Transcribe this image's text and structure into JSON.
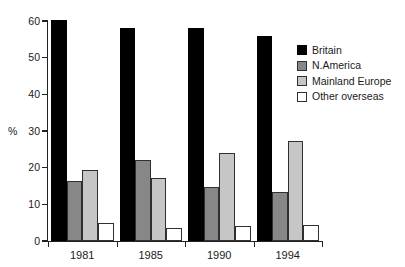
{
  "chart_data": {
    "type": "bar",
    "title": "",
    "subtitle": "",
    "xlabel": "",
    "ylabel": "%",
    "categories": [
      "1981",
      "1985",
      "1990",
      "1994"
    ],
    "series": [
      {
        "name": "Britain",
        "color": "#000000",
        "values": [
          60.3,
          58.2,
          58.2,
          56.0
        ]
      },
      {
        "name": "N.America",
        "color": "#878787",
        "values": [
          16.5,
          22.0,
          14.8,
          13.5
        ]
      },
      {
        "name": "Mainland Europe",
        "color": "#c6c6c6",
        "values": [
          19.3,
          17.3,
          24.1,
          27.2
        ]
      },
      {
        "name": "Other overseas",
        "color": "#ffffff",
        "values": [
          4.8,
          3.6,
          4.0,
          4.3
        ]
      }
    ],
    "ylim": [
      0,
      60
    ],
    "yticks": [
      0,
      10,
      20,
      30,
      40,
      50,
      60
    ],
    "ytick_labels": [
      "0",
      "10",
      "20",
      "30",
      "40",
      "50",
      "60"
    ],
    "grid": false,
    "legend_position": "top-right",
    "legend_entries": [
      "Britain",
      "N.America",
      "Mainland Europe",
      "Other overseas"
    ],
    "annotations": []
  }
}
